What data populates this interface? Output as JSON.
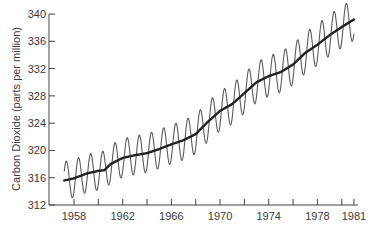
{
  "chart_data": {
    "type": "line",
    "title": "",
    "xlabel": "",
    "ylabel": "Carbon Dioxide (parts per million)",
    "xlim": [
      1957.0,
      1981.0
    ],
    "ylim": [
      312,
      340
    ],
    "grid": false,
    "legend": null,
    "x_tick_labels": [
      "1958",
      "1962",
      "1966",
      "1970",
      "1974",
      "1978",
      "1981"
    ],
    "x_tick_values": [
      1958,
      1962,
      1966,
      1970,
      1974,
      1978,
      1981
    ],
    "x_minor_ticks": [
      1960,
      1964,
      1968,
      1972,
      1976,
      1980
    ],
    "y_tick_labels": [
      "312",
      "316",
      "320",
      "324",
      "328",
      "332",
      "336",
      "340"
    ],
    "y_tick_values": [
      312,
      316,
      320,
      324,
      328,
      332,
      336,
      340
    ],
    "series": [
      {
        "name": "Annual trend (smoothed)",
        "style": "thick",
        "color": "#222222",
        "x": [
          1957.2,
          1958,
          1959,
          1960,
          1960.5,
          1961,
          1962,
          1963,
          1964,
          1965,
          1966,
          1967,
          1968,
          1969,
          1970,
          1971,
          1972,
          1973,
          1974,
          1975,
          1976,
          1977,
          1978,
          1979,
          1980,
          1981
        ],
        "values": [
          315.6,
          315.9,
          316.6,
          317.0,
          317.1,
          318.0,
          318.9,
          319.3,
          319.6,
          320.2,
          320.9,
          321.5,
          322.4,
          324.2,
          325.8,
          326.8,
          328.4,
          330.0,
          330.9,
          331.5,
          332.6,
          334.3,
          335.5,
          336.9,
          338.1,
          339.2
        ]
      },
      {
        "name": "Monthly concentration (seasonal oscillation)",
        "style": "thin",
        "color": "#555555",
        "seasonal_amplitude_ppm": 2.9,
        "peak_phase_year_fraction": 0.37,
        "start_year": 1957.2,
        "end_year": 1981.0
      }
    ]
  }
}
